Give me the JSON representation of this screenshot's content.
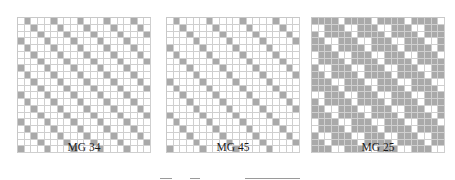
{
  "figure": {
    "panels": [
      {
        "id": "mg34",
        "label": "MG 34",
        "rows": 20,
        "cols": 20,
        "period": 4,
        "rule": "shaded when (col - row) mod 4 == 1",
        "shaded_offsets": [
          1
        ],
        "extra_odd_row_offsets": [],
        "shaded_color": "#a9a9a9",
        "left": 17
      },
      {
        "id": "mg45",
        "label": "MG 45",
        "rows": 20,
        "cols": 20,
        "period": 5,
        "rule": "shaded when (col - row) mod 5 == 1",
        "shaded_offsets": [
          1
        ],
        "extra_odd_row_offsets": [],
        "shaded_color": "#a9a9a9",
        "left": 166
      },
      {
        "id": "mg25",
        "label": "MG 25",
        "rows": 20,
        "cols": 20,
        "period": 5,
        "rule": "mostly shaded; white diagonal staircase when (col - row) mod 5 == 4, plus adjacent white on odd rows",
        "white_offsets": [
          4
        ],
        "extra_white_odd_row_offsets": [
          0
        ],
        "shaded_color": "#a9a9a9",
        "left": 311
      }
    ],
    "grid_line_color": "#cfcfcf",
    "background": "#ffffff"
  }
}
